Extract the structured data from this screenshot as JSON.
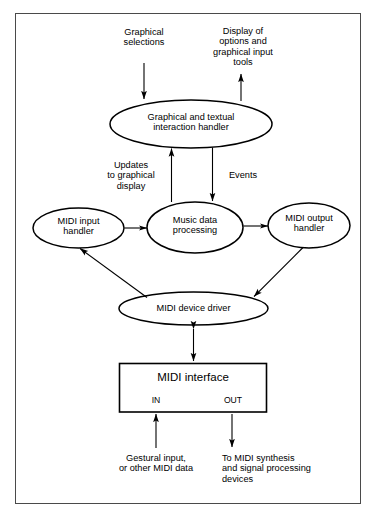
{
  "figure": {
    "kind": "block-diagram",
    "title": "",
    "background_color": "#ffffff",
    "frame_color": "#4a4a4a",
    "stroke_color": "#000000",
    "text_color": "#000000"
  },
  "nodes": [
    {
      "id": "interaction_handler",
      "shape": "ellipse",
      "label": "Graphical and textual\ninteraction handler"
    },
    {
      "id": "midi_input_handler",
      "shape": "ellipse",
      "label": "MIDI input\nhandler"
    },
    {
      "id": "music_data_processing",
      "shape": "ellipse",
      "label": "Music data\nprocessing"
    },
    {
      "id": "midi_output_handler",
      "shape": "ellipse",
      "label": "MIDI output\nhandler"
    },
    {
      "id": "midi_device_driver",
      "shape": "ellipse",
      "label": "MIDI device driver"
    },
    {
      "id": "midi_interface",
      "shape": "rectangle",
      "label": "MIDI interface"
    }
  ],
  "ports": [
    {
      "id": "port_in",
      "label": "IN"
    },
    {
      "id": "port_out",
      "label": "OUT"
    }
  ],
  "annotations": [
    {
      "id": "graphical_selections",
      "label": "Graphical\nselections"
    },
    {
      "id": "display_of_options",
      "label": "Display of\noptions and\ngraphical input\ntools"
    },
    {
      "id": "updates_to_graphical_display",
      "label": "Updates\nto graphical\ndisplay"
    },
    {
      "id": "events",
      "label": "Events"
    },
    {
      "id": "gestural_input",
      "label": "Gestural input,\nor other MIDI data"
    },
    {
      "id": "to_midi_synthesis",
      "label": "To MIDI synthesis\nand signal processing\ndevices"
    }
  ],
  "edges": [
    {
      "from": "graphical_selections",
      "to": "interaction_handler",
      "arrow": "single"
    },
    {
      "from": "interaction_handler",
      "to": "display_of_options",
      "arrow": "single"
    },
    {
      "from": "music_data_processing",
      "to": "interaction_handler",
      "arrow": "single",
      "label": "Updates to graphical display"
    },
    {
      "from": "interaction_handler",
      "to": "music_data_processing",
      "arrow": "single",
      "label": "Events"
    },
    {
      "from": "midi_input_handler",
      "to": "music_data_processing",
      "arrow": "single"
    },
    {
      "from": "music_data_processing",
      "to": "midi_output_handler",
      "arrow": "single"
    },
    {
      "from": "midi_device_driver",
      "to": "midi_input_handler",
      "arrow": "single"
    },
    {
      "from": "midi_output_handler",
      "to": "midi_device_driver",
      "arrow": "single"
    },
    {
      "from": "midi_device_driver",
      "to": "midi_interface",
      "arrow": "double"
    },
    {
      "from": "gestural_input",
      "to": "port_in",
      "arrow": "single"
    },
    {
      "from": "port_out",
      "to": "to_midi_synthesis",
      "arrow": "single"
    }
  ]
}
